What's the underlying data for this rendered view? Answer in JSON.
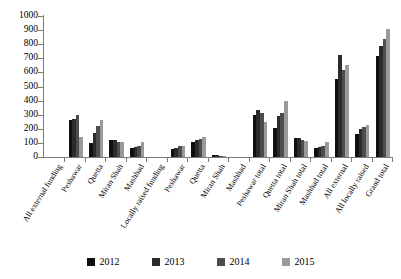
{
  "chart_data": {
    "type": "bar",
    "title": "",
    "subtitle": "",
    "xlabel": "",
    "ylabel": "",
    "ylim": [
      0,
      1000
    ],
    "ytick_step": 100,
    "yticks": [
      0,
      100,
      200,
      300,
      400,
      500,
      600,
      700,
      800,
      900,
      1000
    ],
    "ytick_labels": [
      "0",
      "100",
      "200",
      "300",
      "400",
      "500",
      "600",
      "700",
      "800",
      "900",
      "1000"
    ],
    "grid": false,
    "legend_position": "bottom",
    "categories": [
      "All external funding",
      "Peshawar",
      "Quetta",
      "Miran Shah",
      "Mashhad",
      "Locally raised funding",
      "Peshawar",
      "Quetta",
      "Miran Shah",
      "Mashhad",
      "Peshawar total",
      "Quetta total",
      "Miran Shah total",
      "Mashhad total",
      "All external",
      "All locally raised",
      "Grand total"
    ],
    "series": [
      {
        "name": "2012",
        "color": "#101010",
        "values": [
          null,
          265,
          100,
          120,
          65,
          null,
          55,
          105,
          15,
          0,
          295,
          205,
          135,
          65,
          550,
          165,
          715
        ]
      },
      {
        "name": "2013",
        "color": "#2b2b2b",
        "values": [
          null,
          272,
          170,
          120,
          70,
          null,
          65,
          120,
          15,
          0,
          330,
          290,
          135,
          70,
          725,
          200,
          790
        ]
      },
      {
        "name": "2014",
        "color": "#4d4d4d",
        "values": [
          null,
          300,
          220,
          110,
          75,
          null,
          75,
          130,
          10,
          0,
          310,
          310,
          120,
          80,
          620,
          215,
          835
        ]
      },
      {
        "name": "2015",
        "color": "#9a9a9a",
        "values": [
          null,
          140,
          260,
          110,
          110,
          null,
          80,
          145,
          5,
          0,
          250,
          400,
          115,
          110,
          650,
          230,
          905
        ]
      }
    ]
  },
  "legend": {
    "items": [
      {
        "label": "2012",
        "color": "#101010"
      },
      {
        "label": "2013",
        "color": "#2b2b2b"
      },
      {
        "label": "2014",
        "color": "#4d4d4d"
      },
      {
        "label": "2015",
        "color": "#9a9a9a"
      }
    ]
  }
}
